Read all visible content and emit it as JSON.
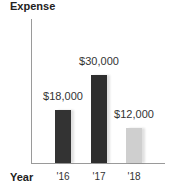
{
  "chart": {
    "title": "Expense",
    "xlabel": "Year"
  },
  "bars": [
    {
      "category": "'16",
      "value_label": "$18,000",
      "color": "#333333"
    },
    {
      "category": "'17",
      "value_label": "$30,000",
      "color": "#2e2e2e"
    },
    {
      "category": "'18",
      "value_label": "$12,000",
      "color": "#cfcfcf"
    }
  ],
  "chart_data": {
    "type": "bar",
    "title": "Expense",
    "xlabel": "Year",
    "ylabel": "Expense",
    "categories": [
      "'16",
      "'17",
      "'18"
    ],
    "values": [
      18000,
      30000,
      12000
    ],
    "value_labels": [
      "$18,000",
      "$30,000",
      "$12,000"
    ],
    "colors": [
      "#333333",
      "#2e2e2e",
      "#cfcfcf"
    ],
    "ylim": [
      0,
      48000
    ],
    "grid": false,
    "legend": null,
    "y_ticks": []
  }
}
